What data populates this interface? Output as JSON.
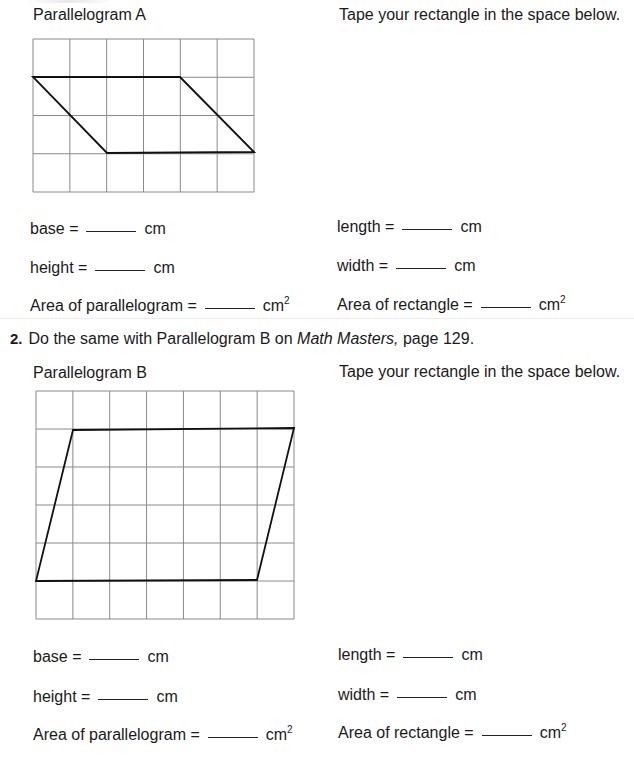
{
  "section1": {
    "left_title": "Parallelogram A",
    "right_title": "Tape your rectangle in the space below.",
    "grid": {
      "cols": 6,
      "rows": 4,
      "x": 33,
      "y": 39,
      "width": 221,
      "height": 153
    },
    "shape_points": "33,77 180,77 254,152 107,153",
    "fields_left": [
      {
        "label": "base =",
        "unit": "cm",
        "sup": ""
      },
      {
        "label": "height =",
        "unit": "cm",
        "sup": ""
      },
      {
        "label": "Area of parallelogram =",
        "unit": "cm",
        "sup": "2"
      }
    ],
    "fields_right": [
      {
        "label": "length =",
        "unit": "cm",
        "sup": ""
      },
      {
        "label": "width =",
        "unit": "cm",
        "sup": ""
      },
      {
        "label": "Area of rectangle =",
        "unit": "cm",
        "sup": "2"
      }
    ]
  },
  "question2": {
    "number": "2.",
    "text_before": "Do the same with Parallelogram B on ",
    "text_italic": "Math Masters,",
    "text_after": " page 129."
  },
  "section2": {
    "left_title": "Parallelogram B",
    "right_title": "Tape your rectangle in the space below.",
    "grid": {
      "cols": 7,
      "rows": 6,
      "x": 36,
      "y": 391,
      "width": 258,
      "height": 228
    },
    "shape_points": "73,430 294,428 257,580 36,581",
    "fields_left": [
      {
        "label": "base =",
        "unit": "cm",
        "sup": ""
      },
      {
        "label": "height =",
        "unit": "cm",
        "sup": ""
      },
      {
        "label": "Area of parallelogram =",
        "unit": "cm",
        "sup": "2"
      }
    ],
    "fields_right": [
      {
        "label": "length =",
        "unit": "cm",
        "sup": ""
      },
      {
        "label": "width =",
        "unit": "cm",
        "sup": ""
      },
      {
        "label": "Area of rectangle =",
        "unit": "cm",
        "sup": "2"
      }
    ]
  }
}
